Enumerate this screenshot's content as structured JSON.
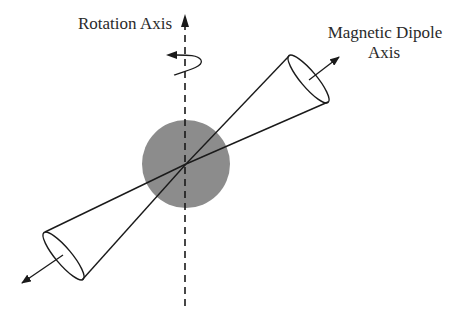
{
  "diagram": {
    "labels": {
      "rotation_axis": "Rotation Axis",
      "dipole_line1": "Magnetic Dipole",
      "dipole_line2": "Axis"
    },
    "colors": {
      "star": "#8c8c8c",
      "line": "#1a1a1a",
      "text": "#2a2a2a"
    },
    "elements": [
      {
        "name": "neutron-star",
        "shape": "circle",
        "center": [
          186,
          164
        ],
        "radius": 44
      },
      {
        "name": "rotation-axis",
        "shape": "dashed-arrow",
        "from": [
          185,
          306
        ],
        "to": [
          185,
          17
        ]
      },
      {
        "name": "rotation-direction",
        "shape": "curl-arrow"
      },
      {
        "name": "upper-emission-cone",
        "shape": "cone",
        "apex": [
          186,
          164
        ]
      },
      {
        "name": "lower-emission-cone",
        "shape": "cone",
        "apex": [
          186,
          164
        ]
      },
      {
        "name": "dipole-arrow-upper",
        "shape": "arrow"
      },
      {
        "name": "dipole-arrow-lower",
        "shape": "arrow"
      }
    ]
  }
}
